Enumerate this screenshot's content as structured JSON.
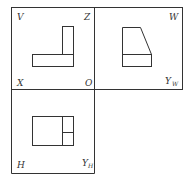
{
  "diagram": {
    "type": "three-view orthographic projection",
    "stroke_color": "#333333",
    "views": {
      "front": {
        "name": "V",
        "corner_labels": {
          "top_left": "V",
          "top_right": "Z",
          "bottom_left": "X",
          "bottom_right": "O"
        }
      },
      "side": {
        "name": "W",
        "corner_labels": {
          "top_right": "W",
          "bottom_right": "Y",
          "bottom_right_sub": "W"
        }
      },
      "top": {
        "name": "H",
        "corner_labels": {
          "bottom_left": "H",
          "bottom_right": "Y",
          "bottom_right_sub": "H"
        }
      }
    }
  }
}
